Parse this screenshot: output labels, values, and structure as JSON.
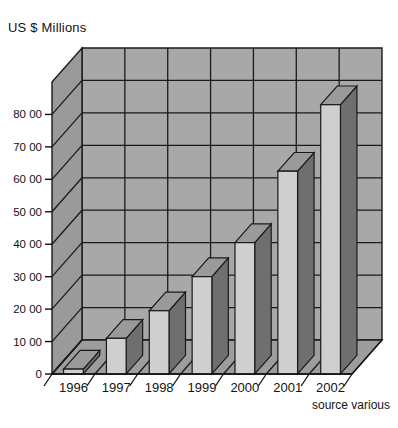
{
  "chart_data": {
    "type": "bar",
    "title": "US $ Millions",
    "xlabel": "",
    "ylabel": "US $ Millions",
    "categories": [
      "1996",
      "1997",
      "1998",
      "1999",
      "2000",
      "2001",
      "2002"
    ],
    "values": [
      1500,
      11000,
      19500,
      30000,
      40500,
      62500,
      83000
    ],
    "series": [
      {
        "name": "US $ Millions",
        "values": [
          1500,
          11000,
          19500,
          30000,
          40500,
          62500,
          83000
        ]
      }
    ],
    "ylim": [
      0,
      90000
    ],
    "ytick_values": [
      0,
      10000,
      20000,
      30000,
      40000,
      50000,
      60000,
      70000,
      80000
    ],
    "ytick_labels": [
      "0",
      "10 00",
      "20 00",
      "30 00",
      "40 00",
      "50 00",
      "60 00",
      "70 00",
      "80 00"
    ],
    "annotations": [
      "source various"
    ],
    "grid": true,
    "legend": "none",
    "style_3d": true
  },
  "labels": {
    "title": "US $ Millions",
    "source_note": "source various"
  },
  "colors": {
    "background": "#ffffff",
    "plot_wall": "#a8a8a8",
    "plot_floor": "#9d9d9d",
    "side_wall": "#9a9a9a",
    "gridline": "#1a1a1a",
    "bar_front": "#cfcfcf",
    "bar_side": "#6f6f6f",
    "bar_top": "#9a9a9a",
    "text": "#131313",
    "axis": "#111111"
  }
}
